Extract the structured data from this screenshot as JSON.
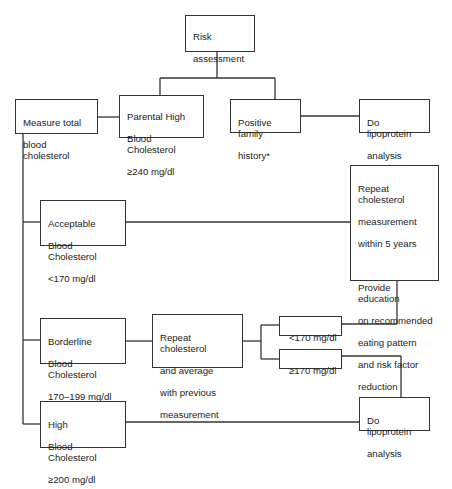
{
  "nodes": {
    "risk_assessment": {
      "lines": [
        "Risk",
        "assessment"
      ]
    },
    "measure_total": {
      "lines": [
        "Measure total",
        "blood cholesterol"
      ]
    },
    "parental_high": {
      "lines": [
        "Parental High",
        "Blood Cholesterol",
        "≥240 mg/dl"
      ]
    },
    "positive_family": {
      "lines": [
        "Positive family",
        "history*"
      ]
    },
    "lipoprotein_top": {
      "lines": [
        "Do lipoprotein",
        "analysis"
      ]
    },
    "repeat_5yr": {
      "lines": [
        "Repeat cholesterol",
        "measurement",
        "within 5 years"
      ],
      "lines2": [
        "Provide education",
        "on recommended",
        "eating pattern",
        "and risk  factor",
        "reduction"
      ]
    },
    "acceptable": {
      "lines": [
        "Acceptable",
        "Blood Cholesterol",
        "<170 mg/dl"
      ]
    },
    "borderline": {
      "lines": [
        "Borderline",
        "Blood Cholesterol",
        "170–199 mg/dl"
      ]
    },
    "repeat_average": {
      "lines": [
        "Repeat cholesterol",
        "and average",
        "with previous",
        "measurement"
      ]
    },
    "lt170": {
      "lines": [
        "<170 mg/dl"
      ]
    },
    "ge170": {
      "lines": [
        "≥170 mg/dl"
      ]
    },
    "lipoprotein_bottom": {
      "lines": [
        "Do lipoprotein",
        "analysis"
      ]
    },
    "high": {
      "lines": [
        "High",
        "Blood Cholesterol",
        "≥200 mg/dl"
      ]
    }
  },
  "colors": {
    "line": "#333333",
    "text": "#222222",
    "background": "#ffffff"
  }
}
